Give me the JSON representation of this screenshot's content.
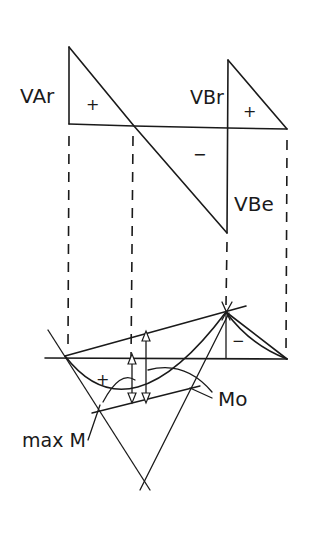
{
  "diagram": {
    "colors": {
      "ink": "#1a1a1a",
      "background": "#ffffff"
    },
    "shear_diagram": {
      "labels": {
        "v_a_r": "VAr",
        "v_b_r": "VBr",
        "v_b_l": "VBe",
        "plus_left": "+",
        "plus_right": "+",
        "minus": "−"
      }
    },
    "moment_diagram": {
      "labels": {
        "plus": "+",
        "minus": "−",
        "m0": "Mo",
        "max_m": "max M"
      }
    }
  }
}
